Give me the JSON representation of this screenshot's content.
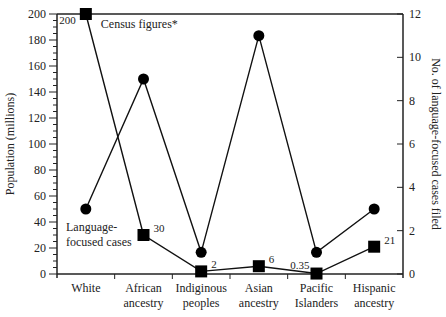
{
  "chart_data": {
    "type": "line",
    "title": "",
    "categories": [
      [
        "White"
      ],
      [
        "African",
        "ancestry"
      ],
      [
        "Indiginous",
        "peoples"
      ],
      [
        "Asian",
        "ancestry"
      ],
      [
        "Pacific",
        "Islanders"
      ],
      [
        "Hispanic",
        "ancestry"
      ]
    ],
    "category_labels": [
      "White",
      "African ancestry",
      "Indiginous peoples",
      "Asian ancestry",
      "Pacific Islanders",
      "Hispanic ancestry"
    ],
    "ylabel": "Population (millions)",
    "ylabel_right": "No. of language-focused cases filed",
    "ylim": [
      0,
      200
    ],
    "ylim_right": [
      0,
      12
    ],
    "yticks": [
      0,
      20,
      40,
      60,
      80,
      100,
      120,
      140,
      160,
      180,
      200
    ],
    "yticks_right": [
      0,
      2,
      4,
      6,
      8,
      10,
      12
    ],
    "grid": false,
    "series": [
      {
        "name": "Census figures*",
        "axis": "left",
        "marker": "square",
        "values": [
          200,
          30,
          2,
          6,
          0.35,
          21
        ],
        "data_labels": [
          "200",
          "30",
          "2",
          "6",
          "0.35",
          "21"
        ]
      },
      {
        "name": "Language-focused cases",
        "axis": "right",
        "marker": "circle",
        "values": [
          3,
          9,
          1,
          11,
          1,
          3
        ]
      }
    ],
    "annotations": [
      {
        "text": "Census figures*",
        "near": "White square"
      },
      {
        "text": "Language-focused cases",
        "near": "White circle"
      }
    ]
  }
}
